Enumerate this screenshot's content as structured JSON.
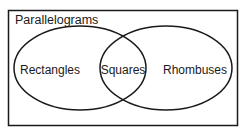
{
  "diagram": {
    "type": "venn",
    "universe": {
      "label": "Parallelograms"
    },
    "sets": [
      {
        "label": "Rectangles"
      },
      {
        "label": "Rhombuses"
      }
    ],
    "intersection": {
      "label": "Squares"
    },
    "colors": {
      "stroke": "#1a1a1a",
      "background": "#ffffff"
    }
  }
}
